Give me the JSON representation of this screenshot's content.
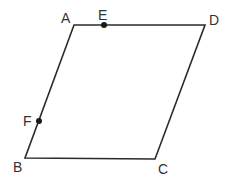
{
  "figure": {
    "type": "parallelogram",
    "stroke_color": "#2b2b2b",
    "label_color": "#333333",
    "vertices": {
      "A": {
        "label": "A",
        "x": 74,
        "y": 25
      },
      "B": {
        "label": "B",
        "x": 25,
        "y": 158
      },
      "C": {
        "label": "C",
        "x": 155,
        "y": 159
      },
      "D": {
        "label": "D",
        "x": 205,
        "y": 25
      }
    },
    "points": {
      "E": {
        "label": "E",
        "on_segment": "AD",
        "x": 104,
        "y": 25
      },
      "F": {
        "label": "F",
        "on_segment": "AB",
        "x": 39,
        "y": 121
      }
    },
    "edges": [
      "AD",
      "DC",
      "CB",
      "BA"
    ]
  }
}
